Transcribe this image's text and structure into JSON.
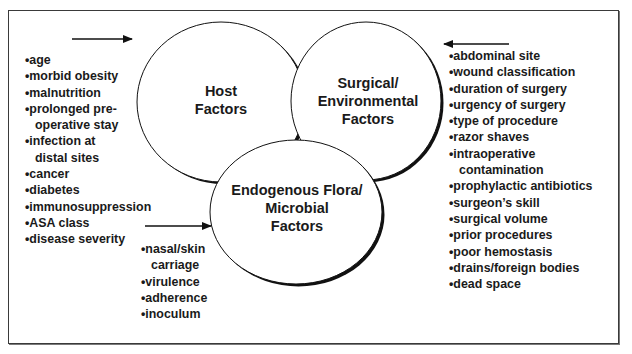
{
  "diagram": {
    "title": "",
    "circles": [
      {
        "id": "host",
        "label_lines": [
          "Host",
          "Factors"
        ]
      },
      {
        "id": "surgical",
        "label_lines": [
          "Surgical/",
          "Environmental",
          "Factors"
        ]
      },
      {
        "id": "microbial",
        "label_lines": [
          "Endogenous Flora/",
          "Microbial",
          "Factors"
        ]
      }
    ],
    "lists": {
      "host": {
        "bullet": "•",
        "items": [
          {
            "text": "age"
          },
          {
            "text": "morbid obesity"
          },
          {
            "text": "malnutrition"
          },
          {
            "text": "prolonged pre-",
            "cont": "operative stay"
          },
          {
            "text": "infection at",
            "cont": "distal sites"
          },
          {
            "text": "cancer"
          },
          {
            "text": "diabetes"
          },
          {
            "text": "immunosuppression"
          },
          {
            "text": "ASA class"
          },
          {
            "text": "disease severity"
          }
        ]
      },
      "surgical": {
        "bullet": "•",
        "items": [
          {
            "text": "abdominal site"
          },
          {
            "text": "wound classification"
          },
          {
            "text": "duration of surgery"
          },
          {
            "text": "urgency of surgery"
          },
          {
            "text": "type of procedure"
          },
          {
            "text": "razor shaves"
          },
          {
            "text": "intraoperative",
            "cont": "contamination"
          },
          {
            "text": "prophylactic antibiotics"
          },
          {
            "text": "surgeon’s skill"
          },
          {
            "text": "surgical volume"
          },
          {
            "text": "prior procedures"
          },
          {
            "text": "poor hemostasis"
          },
          {
            "text": "drains/foreign bodies"
          },
          {
            "text": "dead space"
          }
        ]
      },
      "microbial": {
        "bullet": "•",
        "items": [
          {
            "text": "nasal/skin",
            "cont": "carriage"
          },
          {
            "text": "virulence"
          },
          {
            "text": "adherence"
          },
          {
            "text": "inoculum"
          }
        ]
      }
    },
    "arrows": [
      {
        "id": "host-arrow",
        "direction": "right"
      },
      {
        "id": "surgical-arrow",
        "direction": "left"
      },
      {
        "id": "microbial-arrow",
        "direction": "right"
      }
    ],
    "colors": {
      "stroke": "#111111",
      "text": "#1a1a1a",
      "background": "#ffffff",
      "frame": "#3a3a3a"
    }
  }
}
